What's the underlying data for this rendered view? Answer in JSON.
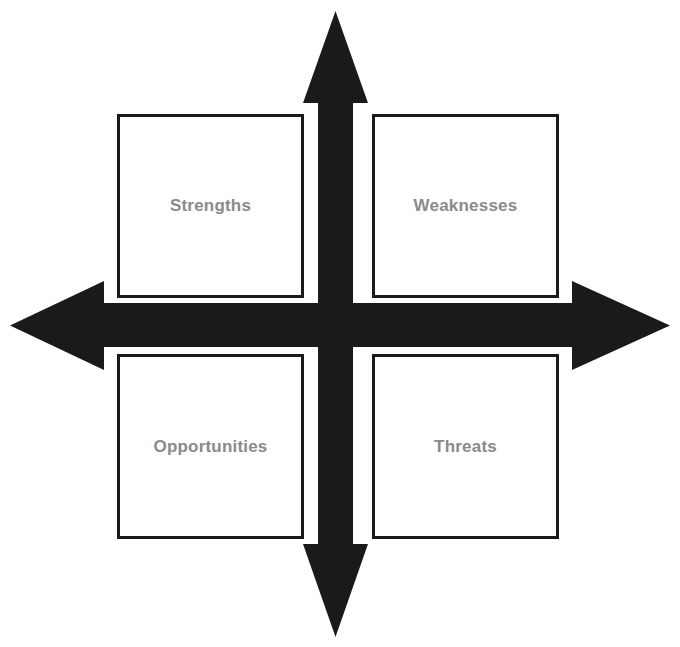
{
  "diagram": {
    "kind": "swot-matrix",
    "background_color": "#ffffff",
    "arrow_color": "#1a1a1a",
    "box_border_color": "#1a1a1a",
    "box_fill_color": "#ffffff",
    "label_color": "#8a8a8a",
    "axes": {
      "vertical_arrow_name": "vertical-double-arrow",
      "horizontal_arrow_name": "horizontal-double-arrow"
    },
    "quadrants": [
      {
        "id": "strengths",
        "label": "Strengths",
        "position": "top-left",
        "icon": "square-outline-icon"
      },
      {
        "id": "weaknesses",
        "label": "Weaknesses",
        "position": "top-right",
        "icon": "square-outline-icon"
      },
      {
        "id": "opportunities",
        "label": "Opportunities",
        "position": "bottom-left",
        "icon": "square-outline-icon"
      },
      {
        "id": "threats",
        "label": "Threats",
        "position": "bottom-right",
        "icon": "square-outline-icon"
      }
    ]
  }
}
